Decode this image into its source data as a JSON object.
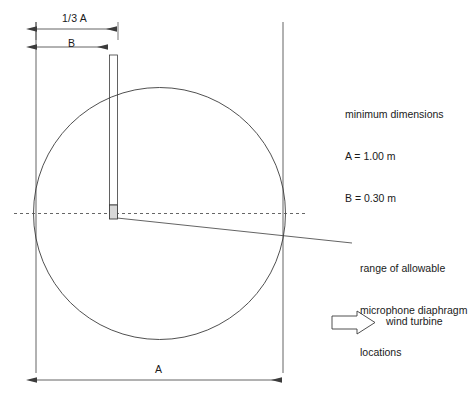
{
  "diagram": {
    "dimensions": {
      "third_a_label": "1/3 A",
      "b_label": "B",
      "a_label": "A"
    },
    "notes": {
      "heading": "minimum dimensions",
      "line_a": "A = 1.00 m",
      "line_b": "B = 0.30 m"
    },
    "range_note": {
      "line1": "range of allowable",
      "line2": "microphone diaphragm",
      "line3": "locations"
    },
    "legend": {
      "turbine_label": "wind turbine",
      "turbine_icon": "block-arrow-right-icon"
    },
    "colors": {
      "stroke": "#3c3c3c",
      "text": "#1a1a1a",
      "background": "#ffffff",
      "centerline": "#555555"
    },
    "geometry": {
      "circle_center_x": 159.5,
      "circle_center_y": 213.5,
      "circle_radius": 126,
      "board_left_x": 36,
      "board_right_x": 283,
      "board_top_y": 22,
      "board_bottom_y": 373,
      "mast_left_x": 109,
      "mast_right_x": 118,
      "mast_top_y": 55,
      "mic_box_top_y": 205,
      "mic_box_bottom_y": 219,
      "centerline_start_x": 14,
      "centerline_end_x": 305,
      "centerline_y": 213.5,
      "dim_third_a_y": 29,
      "dim_b_y": 47,
      "dim_a_y": 380
    }
  }
}
